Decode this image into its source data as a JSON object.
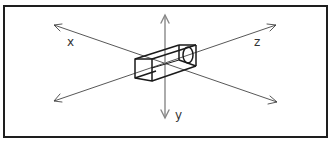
{
  "diagram": {
    "axes": {
      "x_label": "x",
      "y_label": "y",
      "z_label": "z"
    },
    "object": "rectangular-box-with-circular-hole",
    "colors": {
      "frame": "#1e1e1e",
      "axis": "#444444",
      "vertical_axis": "#888888",
      "box": "#1a1a1a",
      "background": "#ffffff"
    }
  }
}
